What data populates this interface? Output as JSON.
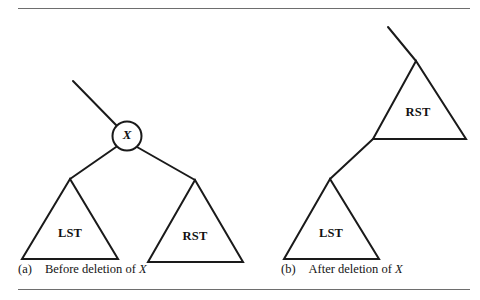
{
  "figure": {
    "panels": [
      {
        "id": "panel-a",
        "caption_tag": "(a)",
        "caption_text": "Before deletion of ",
        "caption_var": "X",
        "node_label": "X",
        "subtrees": [
          {
            "name": "LST",
            "label": "LST"
          },
          {
            "name": "RST",
            "label": "RST"
          }
        ]
      },
      {
        "id": "panel-b",
        "caption_tag": "(b)",
        "caption_text": "After deletion of ",
        "caption_var": "X",
        "subtrees": [
          {
            "name": "RST",
            "label": "RST"
          },
          {
            "name": "LST",
            "label": "LST"
          }
        ]
      }
    ],
    "colors": {
      "ink": "#1a1a1a",
      "rule": "#6e6e6e",
      "background": "#ffffff"
    }
  }
}
